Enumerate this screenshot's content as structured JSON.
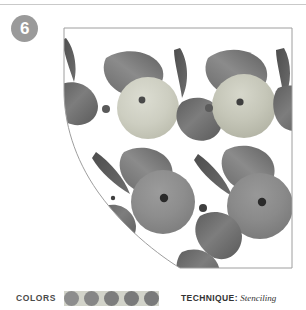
{
  "page": {
    "number_badge": "6",
    "background": "#ffffff",
    "rule_color": "#c9c9c9"
  },
  "legend": {
    "colors_label": "COLORS",
    "technique_label": "TECHNIQUE:",
    "technique_value": "Stenciling",
    "swatches": [
      {
        "name": "pale-green",
        "hex": "#d2d3c9"
      },
      {
        "name": "medium-gray-green",
        "hex": "#8d8d8d"
      },
      {
        "name": "medium-gray",
        "hex": "#868686"
      },
      {
        "name": "dark-gray",
        "hex": "#7d7d7d"
      },
      {
        "name": "deep-gray",
        "hex": "#7a7a7a"
      }
    ]
  },
  "artwork": {
    "title": "Fruit and leaf stencil pattern",
    "panel_outline_color": "#9e9e9e",
    "panel_fill": "#ffffff",
    "motifs": [
      {
        "type": "fruit-light",
        "cx": 86,
        "cy": 82,
        "r": 31,
        "fill": "#cfd0c4",
        "seed": "#4e4e4e"
      },
      {
        "type": "fruit-light",
        "cx": 182,
        "cy": 80,
        "r": 32,
        "fill": "#c2c2b5",
        "seed": "#4a4a4a"
      },
      {
        "type": "fruit-dark",
        "cx": 101,
        "cy": 176,
        "r": 32,
        "fill": "#8e8e8e",
        "seed": "#2f2f2f"
      },
      {
        "type": "fruit-dark",
        "cx": 198,
        "cy": 180,
        "r": 33,
        "fill": "#8a8a8a",
        "seed": "#2e2e2e"
      },
      {
        "type": "berry",
        "cx": 44,
        "cy": 83,
        "r": 4,
        "fill": "#5a5a5a"
      },
      {
        "type": "berry",
        "cx": 147,
        "cy": 82,
        "r": 4,
        "fill": "#5a5a5a"
      },
      {
        "type": "berry",
        "cx": 141,
        "cy": 182,
        "r": 4,
        "fill": "#3f3f3f"
      },
      {
        "type": "berry",
        "cx": 51,
        "cy": 172,
        "r": 2,
        "fill": "#3f3f3f"
      }
    ],
    "leaf_count": 14
  }
}
